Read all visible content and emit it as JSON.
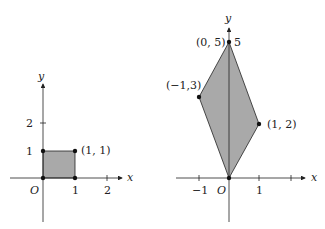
{
  "left_panel": {
    "axis_x_label": "x",
    "axis_y_label": "y",
    "origin_label": "O",
    "x_ticks": [
      "1",
      "2"
    ],
    "y_ticks": [
      "1",
      "2"
    ],
    "shape": "square",
    "vertices": [
      [
        0,
        0
      ],
      [
        1,
        0
      ],
      [
        1,
        1
      ],
      [
        0,
        1
      ]
    ],
    "point_label": "(1, 1)",
    "fill_color": "#a9a9a9"
  },
  "right_panel": {
    "axis_x_label": "x",
    "axis_y_label": "y",
    "origin_label": "O",
    "x_ticks": [
      "-1",
      "1"
    ],
    "x_tick_labels": [
      "−1",
      "1"
    ],
    "y_tick_label_5": "5",
    "shape": "parallelogram",
    "vertices": [
      [
        0,
        0
      ],
      [
        1,
        2
      ],
      [
        0,
        5
      ],
      [
        -1,
        3
      ]
    ],
    "point_labels": {
      "top": "(0, 5)",
      "left": "(−1,3)",
      "right": "(1, 2)"
    },
    "fill_color": "#a9a9a9"
  }
}
